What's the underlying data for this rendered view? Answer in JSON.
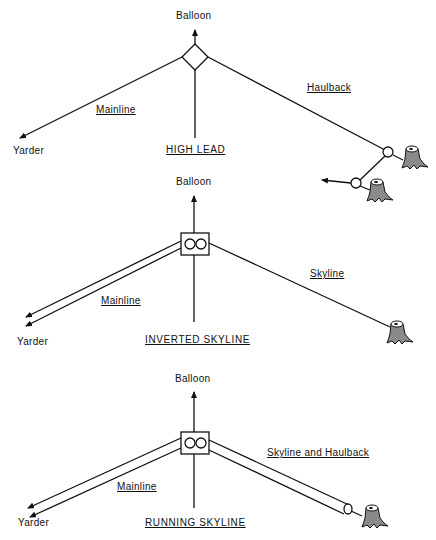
{
  "diagrams": [
    {
      "title": "HIGH LEAD",
      "top_label": "Balloon",
      "left_label": "Yarder",
      "mainline_label": "Mainline",
      "right_line_label": "Haulback",
      "carriage": "diamond"
    },
    {
      "title": "INVERTED SKYLINE",
      "top_label": "Balloon",
      "left_label": "Yarder",
      "mainline_label": "Mainline",
      "right_line_label": "Skyline",
      "carriage": "two-sheave-block"
    },
    {
      "title": "RUNNING SKYLINE",
      "top_label": "Balloon",
      "left_label": "Yarder",
      "mainline_label": "Mainline",
      "right_line_label": "Skyline and Haulback",
      "carriage": "two-sheave-block"
    }
  ],
  "colors": {
    "line": "#111111",
    "stump": "#8a8a8a"
  }
}
